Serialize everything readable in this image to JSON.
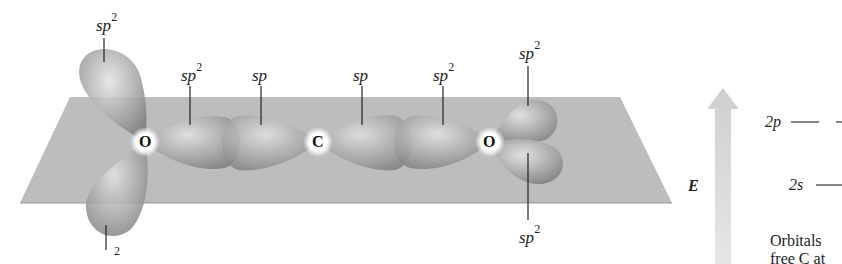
{
  "diagram": {
    "atoms": [
      {
        "symbol": "O",
        "x": 145,
        "y": 142
      },
      {
        "symbol": "C",
        "x": 318,
        "y": 142
      },
      {
        "symbol": "O",
        "x": 490,
        "y": 142
      }
    ],
    "orbital_labels": [
      {
        "base": "sp",
        "sup": "2",
        "x": 96,
        "y": 14
      },
      {
        "base": "sp",
        "sup": "2",
        "x": 181,
        "y": 64
      },
      {
        "base": "sp",
        "sup": "",
        "x": 251,
        "y": 67
      },
      {
        "base": "sp",
        "sup": "",
        "x": 353,
        "y": 67
      },
      {
        "base": "sp",
        "sup": "2",
        "x": 433,
        "y": 64
      },
      {
        "base": "sp",
        "sup": "2",
        "x": 519,
        "y": 40
      },
      {
        "base": "sp",
        "sup": "2",
        "x": 519,
        "y": 228
      },
      {
        "base": "",
        "sup": "2",
        "x": 110,
        "y": 248
      }
    ],
    "energy_panel": {
      "axis_label": "E",
      "levels": [
        {
          "label": "2p",
          "y": 122
        },
        {
          "label": "2s",
          "y": 185
        }
      ],
      "caption_line1": "Orbitals",
      "caption_line2": "free C at"
    },
    "colors": {
      "plane": "#b4b4b4",
      "lobe": "#9c9c9c",
      "arrow": "#d6d6d6"
    }
  }
}
